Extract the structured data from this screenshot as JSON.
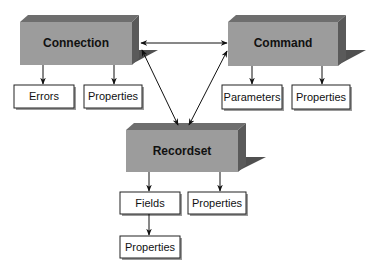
{
  "diagram": {
    "colors": {
      "box_front": "#9c9c9c",
      "box_top": "#6e6e6e",
      "box_side": "#5a5a5a",
      "box_shadow": "#505050",
      "leaf_fill": "#ffffff",
      "leaf_stroke": "#222222",
      "leaf_shadow": "#9a9a9a",
      "arrow": "#111111"
    },
    "main_objects": [
      {
        "id": "connection",
        "label": "Connection"
      },
      {
        "id": "command",
        "label": "Command"
      },
      {
        "id": "recordset",
        "label": "Recordset"
      }
    ],
    "collections": {
      "connection_errors": "Errors",
      "connection_properties": "Properties",
      "command_parameters": "Parameters",
      "command_properties": "Properties",
      "recordset_fields": "Fields",
      "recordset_properties": "Properties",
      "fields_properties": "Properties"
    },
    "relationships": [
      {
        "from": "connection",
        "to": "command",
        "type": "bidirectional"
      },
      {
        "from": "connection",
        "to": "recordset",
        "type": "bidirectional"
      },
      {
        "from": "command",
        "to": "recordset",
        "type": "bidirectional"
      },
      {
        "from": "connection",
        "to": "connection_errors",
        "type": "directed"
      },
      {
        "from": "connection",
        "to": "connection_properties",
        "type": "directed"
      },
      {
        "from": "command",
        "to": "command_parameters",
        "type": "directed"
      },
      {
        "from": "command",
        "to": "command_properties",
        "type": "directed"
      },
      {
        "from": "recordset",
        "to": "recordset_fields",
        "type": "directed"
      },
      {
        "from": "recordset",
        "to": "recordset_properties",
        "type": "directed"
      },
      {
        "from": "recordset_fields",
        "to": "fields_properties",
        "type": "directed"
      }
    ]
  }
}
